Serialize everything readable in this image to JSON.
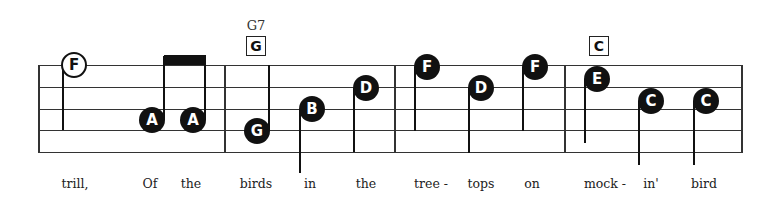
{
  "staff": {
    "left": 38,
    "right": 741,
    "lines_y": [
      65,
      87,
      109,
      130,
      152
    ],
    "barlines_x": [
      38,
      224,
      394,
      564,
      741
    ]
  },
  "chords": [
    {
      "name": "G7",
      "box": "G",
      "x": 256
    },
    {
      "name": "",
      "box": "C",
      "x": 599
    }
  ],
  "notes": [
    {
      "letter": "F",
      "x": 74,
      "y": 65,
      "style": "open",
      "stem": {
        "dir": "down-left",
        "x": 63,
        "y1": 65,
        "y2": 130
      }
    },
    {
      "letter": "A",
      "x": 152,
      "y": 120,
      "style": "filled",
      "stem": {
        "dir": "up-right",
        "x": 164,
        "y1": 56,
        "y2": 120
      }
    },
    {
      "letter": "A",
      "x": 193,
      "y": 120,
      "style": "filled",
      "stem": {
        "dir": "up-right",
        "x": 205,
        "y1": 56,
        "y2": 120
      }
    },
    {
      "letter": "G",
      "x": 257,
      "y": 131,
      "style": "filled",
      "stem": {
        "dir": "up-right",
        "x": 269,
        "y1": 65,
        "y2": 131
      }
    },
    {
      "letter": "B",
      "x": 312,
      "y": 109,
      "style": "filled",
      "stem": {
        "dir": "down-left",
        "x": 300,
        "y1": 109,
        "y2": 173
      }
    },
    {
      "letter": "D",
      "x": 366,
      "y": 88,
      "style": "filled",
      "stem": {
        "dir": "down-left",
        "x": 354,
        "y1": 88,
        "y2": 152
      }
    },
    {
      "letter": "F",
      "x": 427,
      "y": 67,
      "style": "filled",
      "stem": {
        "dir": "down-left",
        "x": 415,
        "y1": 67,
        "y2": 131
      }
    },
    {
      "letter": "D",
      "x": 481,
      "y": 88,
      "style": "filled",
      "stem": {
        "dir": "down-left",
        "x": 469,
        "y1": 88,
        "y2": 153
      }
    },
    {
      "letter": "F",
      "x": 535,
      "y": 67,
      "style": "filled",
      "stem": {
        "dir": "down-left",
        "x": 523,
        "y1": 67,
        "y2": 131
      }
    },
    {
      "letter": "E",
      "x": 597,
      "y": 79,
      "style": "filled",
      "stem": {
        "dir": "down-left",
        "x": 585,
        "y1": 79,
        "y2": 143
      }
    },
    {
      "letter": "C",
      "x": 651,
      "y": 101,
      "style": "filled",
      "stem": {
        "dir": "down-left",
        "x": 639,
        "y1": 101,
        "y2": 165
      }
    },
    {
      "letter": "C",
      "x": 706,
      "y": 101,
      "style": "filled",
      "stem": {
        "dir": "down-left",
        "x": 694,
        "y1": 101,
        "y2": 165
      }
    }
  ],
  "beams": [
    {
      "x1": 164,
      "x2": 206,
      "y": 55,
      "h": 10
    }
  ],
  "lyrics": [
    {
      "text": "trill,",
      "x": 75
    },
    {
      "text": "Of",
      "x": 150
    },
    {
      "text": "the",
      "x": 191
    },
    {
      "text": "birds",
      "x": 256
    },
    {
      "text": "in",
      "x": 310
    },
    {
      "text": "the",
      "x": 366
    },
    {
      "text": "tree -",
      "x": 431
    },
    {
      "text": "tops",
      "x": 481
    },
    {
      "text": "on",
      "x": 532
    },
    {
      "text": "mock -",
      "x": 605
    },
    {
      "text": "in'",
      "x": 651
    },
    {
      "text": "bird",
      "x": 704
    }
  ]
}
